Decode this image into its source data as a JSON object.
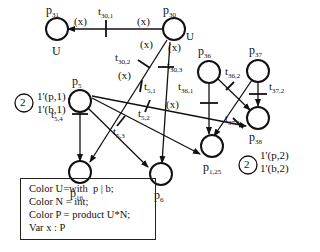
{
  "places": {
    "p31": {
      "name": "p",
      "sub": "31",
      "color": "U"
    },
    "p30": {
      "name": "p",
      "sub": "30",
      "color": "U"
    },
    "p5": {
      "name": "p",
      "sub": "5"
    },
    "p36": {
      "name": "p",
      "sub": "36"
    },
    "p37": {
      "name": "p",
      "sub": "37"
    },
    "p16": {
      "name": "p",
      "sub": "16"
    },
    "p6": {
      "name": "p",
      "sub": "6"
    },
    "p125": {
      "name": "p",
      "sub": "1,25"
    },
    "p38": {
      "name": "p",
      "sub": "38"
    }
  },
  "transitions": {
    "t30_1": {
      "name": "t",
      "sub": "30,1"
    },
    "t30_2": {
      "name": "t",
      "sub": "30,2"
    },
    "t30_3": {
      "name": "t",
      "sub": "30,3"
    },
    "t5_1": {
      "name": "t",
      "sub": "5,1"
    },
    "t5_2": {
      "name": "t",
      "sub": "5,2"
    },
    "t5_3": {
      "name": "t",
      "sub": "5,3"
    },
    "t5_4": {
      "name": "t",
      "sub": "5,4"
    },
    "t36_1": {
      "name": "t",
      "sub": "36,1"
    },
    "t36_2": {
      "name": "t",
      "sub": "36,2"
    },
    "t37_1": {
      "name": "t",
      "sub": "37,1"
    },
    "t37_2": {
      "name": "t",
      "sub": "37,2"
    }
  },
  "arc_labels": {
    "x": "(x)"
  },
  "markings": {
    "p5": {
      "count": "2",
      "line1": "1'(p,1)",
      "line2": "1'(b,1)"
    },
    "p38": {
      "count": "2",
      "line1": "1'(p,2)",
      "line2": "1'(b,2)"
    }
  },
  "declarations": [
    "Color U=with  p | b;",
    "Color N = int;",
    "Color P = product U*N;",
    "Var x : P"
  ]
}
